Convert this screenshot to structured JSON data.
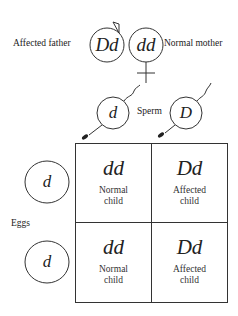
{
  "parents": {
    "father": {
      "label": "Affected father",
      "genotype": "Dd",
      "symbol": "male"
    },
    "mother": {
      "label": "Normal mother",
      "genotype": "dd",
      "symbol": "female"
    }
  },
  "sperm": {
    "label": "Sperm",
    "alleles": [
      "d",
      "D"
    ]
  },
  "eggs": {
    "label": "Eggs",
    "alleles": [
      "d",
      "d"
    ]
  },
  "punnett": {
    "cells": [
      {
        "genotype": "dd",
        "phenotype_line1": "Normal",
        "phenotype_line2": "child"
      },
      {
        "genotype": "Dd",
        "phenotype_line1": "Affected",
        "phenotype_line2": "child"
      },
      {
        "genotype": "dd",
        "phenotype_line1": "Normal",
        "phenotype_line2": "child"
      },
      {
        "genotype": "Dd",
        "phenotype_line1": "Affected",
        "phenotype_line2": "child"
      }
    ]
  },
  "colors": {
    "line": "#333333",
    "text": "#222222",
    "background": "#ffffff"
  }
}
